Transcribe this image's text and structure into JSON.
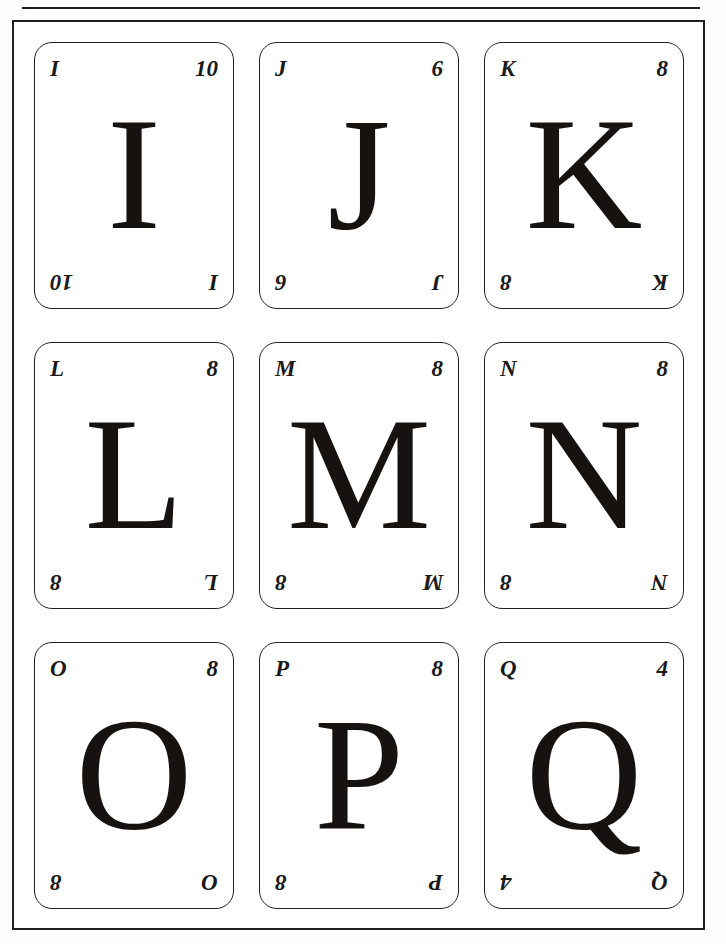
{
  "page": {
    "top_rule": true,
    "frame": true,
    "background_color": "#ffffff",
    "ink_color": "#231f20"
  },
  "grid": {
    "rows": 3,
    "columns": 3
  },
  "cards": [
    {
      "letter": "I",
      "number": "10",
      "index_top_left": "I",
      "index_top_right": "10",
      "index_bottom_left": "10",
      "index_bottom_right": "I",
      "center_glyph": "I",
      "position": "row1-col1"
    },
    {
      "letter": "J",
      "number": "6",
      "index_top_left": "J",
      "index_top_right": "6",
      "index_bottom_left": "6",
      "index_bottom_right": "J",
      "center_glyph": "J",
      "position": "row1-col2"
    },
    {
      "letter": "K",
      "number": "8",
      "index_top_left": "K",
      "index_top_right": "8",
      "index_bottom_left": "8",
      "index_bottom_right": "K",
      "center_glyph": "K",
      "position": "row1-col3"
    },
    {
      "letter": "L",
      "number": "8",
      "index_top_left": "L",
      "index_top_right": "8",
      "index_bottom_left": "8",
      "index_bottom_right": "L",
      "center_glyph": "L",
      "position": "row2-col1"
    },
    {
      "letter": "M",
      "number": "8",
      "index_top_left": "M",
      "index_top_right": "8",
      "index_bottom_left": "8",
      "index_bottom_right": "M",
      "center_glyph": "M",
      "position": "row2-col2"
    },
    {
      "letter": "N",
      "number": "8",
      "index_top_left": "N",
      "index_top_right": "8",
      "index_bottom_left": "8",
      "index_bottom_right": "N",
      "center_glyph": "N",
      "position": "row2-col3"
    },
    {
      "letter": "O",
      "number": "8",
      "index_top_left": "O",
      "index_top_right": "8",
      "index_bottom_left": "8",
      "index_bottom_right": "O",
      "center_glyph": "O",
      "position": "row3-col1"
    },
    {
      "letter": "P",
      "number": "8",
      "index_top_left": "P",
      "index_top_right": "8",
      "index_bottom_left": "8",
      "index_bottom_right": "P",
      "center_glyph": "P",
      "position": "row3-col2"
    },
    {
      "letter": "Q",
      "number": "4",
      "index_top_left": "Q",
      "index_top_right": "4",
      "index_bottom_left": "4",
      "index_bottom_right": "Q",
      "center_glyph": "Q",
      "position": "row3-col3"
    }
  ]
}
